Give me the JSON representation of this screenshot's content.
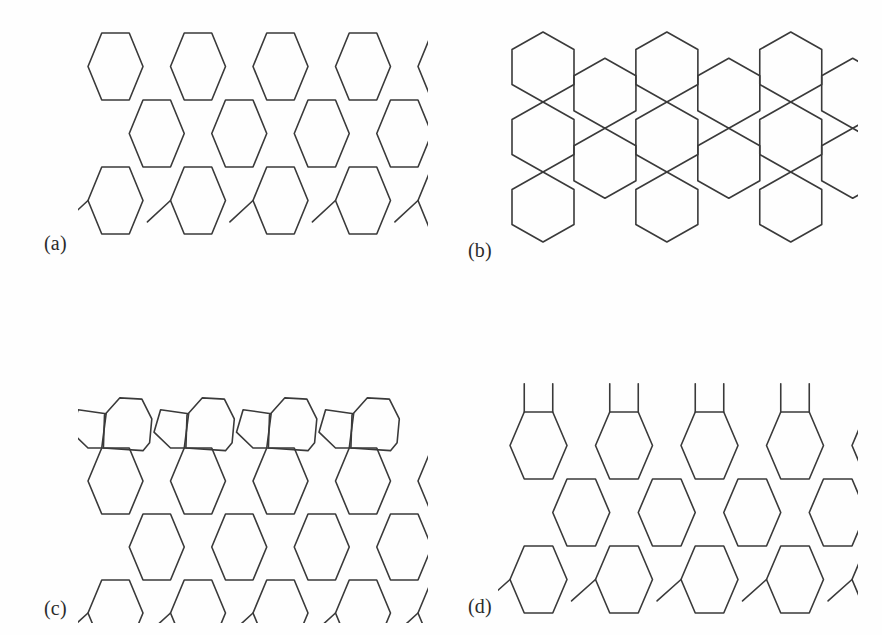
{
  "figure": {
    "type": "scientific-line-figure",
    "background_color": "#fefefe",
    "line_color": "#3a3a3a",
    "line_width": 1.6,
    "width": 882,
    "height": 635
  },
  "panels": [
    {
      "id": "a",
      "label": "(a)",
      "name": "armchair-edge-lattice",
      "description": "Honeycomb lattice with flat-top armchair edge on top and dangling bonds at bottom",
      "columns": 6,
      "rows": 3,
      "has_top_dangling_bonds": false,
      "has_bottom_dangling_bonds": true,
      "defects": []
    },
    {
      "id": "b",
      "label": "(b)",
      "name": "zigzag-edge-lattice",
      "description": "Honeycomb lattice of pointy-top hexagons with staggered zigzag edge, no dangling bonds",
      "columns": 7,
      "rows": 4,
      "has_top_dangling_bonds": false,
      "has_bottom_dangling_bonds": false,
      "defects": []
    },
    {
      "id": "c",
      "label": "(c)",
      "name": "reconstructed-edge-lattice",
      "description": "Honeycomb lattice with a reconstructed top edge formed of alternating pentagons and heptagons; dangling bonds at bottom",
      "columns": 6,
      "rows": 3,
      "has_top_dangling_bonds": false,
      "has_bottom_dangling_bonds": true,
      "defects": [
        "pentagon",
        "heptagon",
        "pentagon",
        "heptagon",
        "pentagon",
        "heptagon",
        "pentagon",
        "heptagon"
      ]
    },
    {
      "id": "d",
      "label": "(d)",
      "name": "dangling-bond-edge-lattice",
      "description": "Honeycomb lattice with vertical dangling bonds along the top edge and dangling bonds at the bottom",
      "columns": 6,
      "rows": 3,
      "has_top_dangling_bonds": true,
      "has_bottom_dangling_bonds": true,
      "defects": []
    }
  ],
  "geometry": {
    "panel_a": {
      "hex_width": 55,
      "hex_height": 67,
      "origin_x": 10,
      "origin_y": 11
    },
    "panel_b": {
      "hex_width": 62,
      "hex_height": 70,
      "origin_x": 14,
      "origin_y": 10
    },
    "panel_c": {
      "hex_width": 55,
      "hex_height": 66,
      "origin_x": 10,
      "origin_y": 60
    },
    "panel_d": {
      "hex_width": 57,
      "hex_height": 67,
      "origin_x": 12,
      "origin_y": 30
    }
  }
}
